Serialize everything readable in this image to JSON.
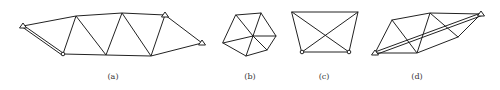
{
  "figure": {
    "type": "truss-structure-panels",
    "panels": [
      {
        "id": "a",
        "label": "(a)"
      },
      {
        "id": "b",
        "label": "(b)"
      },
      {
        "id": "c",
        "label": "(c)"
      },
      {
        "id": "d",
        "label": "(d)"
      }
    ],
    "colors": {
      "line": "#222222",
      "background": "#ffffff"
    }
  }
}
